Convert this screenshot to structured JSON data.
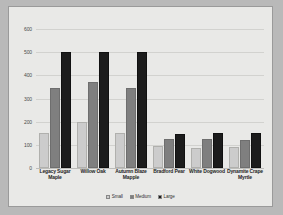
{
  "chart_data": {
    "type": "bar",
    "title": "",
    "subtitle": "",
    "xlabel": "",
    "ylabel": "",
    "ylim": [
      0,
      600
    ],
    "yticks": [
      0,
      100,
      200,
      300,
      400,
      500,
      600
    ],
    "ytick_labels": [
      "0",
      "100",
      "200",
      "300",
      "400",
      "500",
      "600"
    ],
    "grid": true,
    "legend_position": "bottom",
    "categories": [
      "Legacy Sugar Maple",
      "Willow Oak",
      "Autumn Blaze Mapple",
      "Bradford Pear",
      "White Dogwood",
      "Dynamite Crape Myrtle"
    ],
    "series": [
      {
        "name": "Small",
        "color": "#cccccc",
        "values": [
          150,
          200,
          150,
          95,
          85,
          90
        ]
      },
      {
        "name": "Medium",
        "color": "#7f7f7f",
        "values": [
          345,
          370,
          345,
          125,
          125,
          120
        ]
      },
      {
        "name": "Large",
        "color": "#1c1c1c",
        "values": [
          500,
          500,
          500,
          148,
          150,
          150
        ]
      }
    ]
  },
  "figure": {
    "background": "#e9e9e7",
    "border_color": "#9a9a9a",
    "page_background": "#b9b9b9"
  }
}
